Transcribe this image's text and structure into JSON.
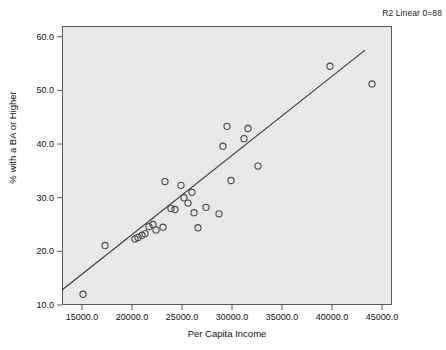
{
  "annotation": "R2 Linear 0=88",
  "chart_data": {
    "type": "scatter",
    "title": "",
    "xlabel": "Per Capita Income",
    "ylabel": "% with a BA or Higher",
    "xlim": [
      13000,
      46000
    ],
    "ylim": [
      10.0,
      62.0
    ],
    "grid": false,
    "legend": "none",
    "xticks": [
      "15000.0",
      "20000.0",
      "25000.0",
      "30000.0",
      "35000.0",
      "40000.0",
      "45000.0"
    ],
    "xtick_values": [
      15000,
      20000,
      25000,
      30000,
      35000,
      40000,
      45000
    ],
    "yticks": [
      "10.0",
      "20.0",
      "30.0",
      "40.0",
      "50.0",
      "60.0"
    ],
    "ytick_values": [
      10.0,
      20.0,
      30.0,
      40.0,
      50.0,
      60.0
    ],
    "marker": "open-circle",
    "marker_color": "#4a4a4a",
    "points": [
      {
        "x": 15100,
        "y": 12.0
      },
      {
        "x": 17300,
        "y": 21.1
      },
      {
        "x": 20300,
        "y": 22.3
      },
      {
        "x": 20600,
        "y": 22.6
      },
      {
        "x": 21000,
        "y": 23.0
      },
      {
        "x": 21300,
        "y": 23.3
      },
      {
        "x": 21700,
        "y": 24.6
      },
      {
        "x": 22100,
        "y": 25.0
      },
      {
        "x": 22400,
        "y": 24.0
      },
      {
        "x": 23100,
        "y": 24.5
      },
      {
        "x": 23300,
        "y": 33.0
      },
      {
        "x": 23900,
        "y": 28.0
      },
      {
        "x": 24300,
        "y": 27.8
      },
      {
        "x": 24900,
        "y": 32.3
      },
      {
        "x": 25200,
        "y": 30.0
      },
      {
        "x": 25600,
        "y": 29.0
      },
      {
        "x": 26000,
        "y": 31.0
      },
      {
        "x": 26200,
        "y": 27.2
      },
      {
        "x": 26600,
        "y": 24.4
      },
      {
        "x": 27400,
        "y": 28.2
      },
      {
        "x": 28700,
        "y": 27.0
      },
      {
        "x": 29100,
        "y": 39.6
      },
      {
        "x": 29500,
        "y": 43.3
      },
      {
        "x": 29900,
        "y": 33.2
      },
      {
        "x": 31200,
        "y": 41.0
      },
      {
        "x": 31600,
        "y": 42.9
      },
      {
        "x": 32600,
        "y": 35.9
      },
      {
        "x": 39800,
        "y": 54.5
      },
      {
        "x": 44000,
        "y": 51.2
      }
    ],
    "fit_line": {
      "type": "linear",
      "x_start": 13000,
      "y_start": 12.8,
      "x_end": 43300,
      "y_end": 57.5,
      "r_squared_label": "R2 Linear 0=88"
    }
  }
}
